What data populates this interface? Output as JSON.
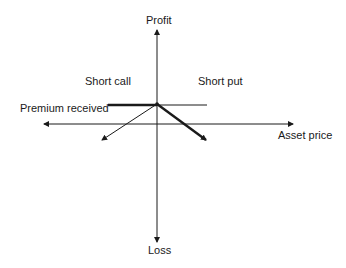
{
  "diagram": {
    "axis_labels": {
      "y_top": "Profit",
      "y_bottom": "Loss",
      "x_right": "Asset price"
    },
    "annotations": {
      "short_call": "Short call",
      "short_put": "Short put",
      "premium": "Premium received"
    },
    "colors": {
      "line": "#1a1a1a",
      "background": "#ffffff"
    }
  }
}
